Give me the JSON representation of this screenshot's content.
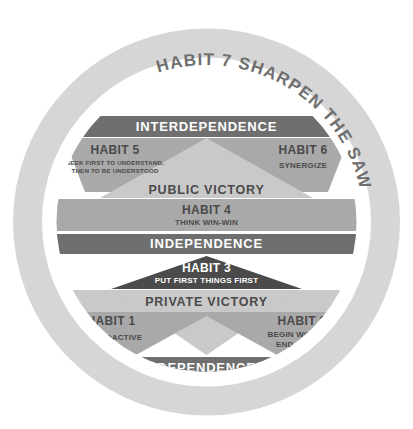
{
  "diagram": {
    "title_on_ring": "HABIT 7 SHARPEN THE SAW",
    "ring_habit_number": "HABIT 7",
    "ring_habit_name": "SHARPEN THE SAW",
    "maturity_levels": {
      "top": "INTERDEPENDENCE",
      "middle": "INDEPENDENCE",
      "bottom": "DEPENDENCE"
    },
    "victories": {
      "public": "PUBLIC VICTORY",
      "private": "PRIVATE VICTORY"
    },
    "habits": {
      "h1": {
        "number": "HABIT 1",
        "name": "BE PROACTIVE"
      },
      "h2": {
        "number": "HABIT 2",
        "name_line1": "BEGIN WITH THE",
        "name_line2": "END IN MIND"
      },
      "h3": {
        "number": "HABIT 3",
        "name": "PUT FIRST THINGS FIRST"
      },
      "h4": {
        "number": "HABIT 4",
        "name": "THINK WIN-WIN"
      },
      "h5": {
        "number": "HABIT 5",
        "name_line1": "SEEK FIRST TO UNDERSTAND,",
        "name_line2": "THEN TO BE UNDERSTOOD"
      },
      "h6": {
        "number": "HABIT 6",
        "name": "SYNERGIZE"
      },
      "h7": {
        "number": "HABIT 7",
        "name": "SHARPEN THE SAW"
      }
    }
  },
  "colors": {
    "background": "#ffffff",
    "ring": "#d6d6d6",
    "band_dark": "#6f6f6f",
    "band_darkest": "#4b4b4b",
    "wing_medium": "#a9a9a9",
    "triangle_light": "#c9c9c9",
    "text_on_dark": "#ffffff",
    "text_on_light": "#4a4a4a",
    "ring_text": "#6f6f6f"
  }
}
